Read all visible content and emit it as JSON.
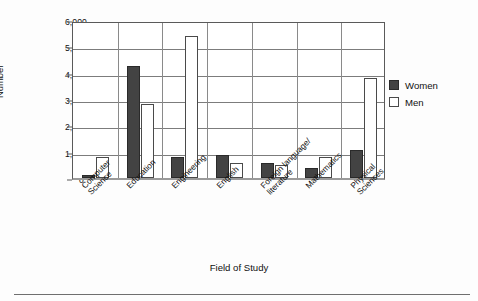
{
  "chart_data": {
    "type": "bar",
    "title": "",
    "xlabel": "Field of Study",
    "ylabel": "Number",
    "ylim": [
      0,
      6000
    ],
    "ytick_labels": [
      "6,000",
      "5,000",
      "4,000",
      "3,000",
      "2,000",
      "1,000",
      "0"
    ],
    "ytick_values": [
      6000,
      5000,
      4000,
      3000,
      2000,
      1000,
      0
    ],
    "grid": "horizontal",
    "legend_position": "top-right-inside",
    "categories": [
      "Computer Science",
      "Education",
      "Engineering",
      "English",
      "Foreign language/ literature",
      "Mathematics",
      "Physical Sciences"
    ],
    "category_label_lines": [
      [
        "Computer",
        "Science"
      ],
      [
        "Education"
      ],
      [
        "Engineering"
      ],
      [
        "English"
      ],
      [
        "Foreign language/",
        "literature"
      ],
      [
        "Mathematics"
      ],
      [
        "Physical",
        "Sciences"
      ]
    ],
    "series": [
      {
        "name": "Women",
        "color": "#434343",
        "values": [
          130,
          4250,
          780,
          880,
          560,
          380,
          1080
        ]
      },
      {
        "name": "Men",
        "color": "#ffffff",
        "values": [
          780,
          2800,
          5380,
          560,
          480,
          800,
          3800
        ]
      }
    ]
  },
  "legend": {
    "items": [
      {
        "label": "Women",
        "swatch": "women"
      },
      {
        "label": "Men",
        "swatch": "men"
      }
    ]
  },
  "axes": {
    "y_title": "Number",
    "x_title": "Field of Study"
  }
}
